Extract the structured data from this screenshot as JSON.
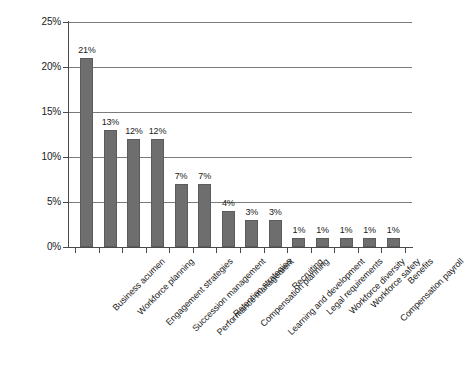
{
  "chart_data": {
    "type": "bar",
    "title": "",
    "subtitle": "",
    "xlabel": "",
    "ylabel": "",
    "ylim": [
      0,
      25
    ],
    "ytick_values": [
      0,
      5,
      10,
      15,
      20,
      25
    ],
    "ytick_labels": [
      "0%",
      "5%",
      "10%",
      "15%",
      "20%",
      "25%"
    ],
    "grid": true,
    "legend": "none",
    "orientation": "vertical",
    "bar_color": "#6e6e6e",
    "bar_edge_color": "#5c5c5c",
    "gridline_color": "#7b7b7b",
    "axis_color": "#4a4a4a",
    "background_color": "#ffffff",
    "value_label_suffix": "%",
    "categories": [
      "Business acumen",
      "Workforce planning",
      "Engagement strategies",
      "Succession management",
      "Performance management",
      "Retention strategies",
      "Compensation planning",
      "Learning and development",
      "Recruiting",
      "Legal requirements",
      "Workforce diversity",
      "Workforce safety",
      "Compensation payroll",
      "Benefits"
    ],
    "values": [
      21,
      13,
      12,
      12,
      7,
      7,
      4,
      3,
      3,
      1,
      1,
      1,
      1,
      1
    ],
    "value_labels": [
      "21%",
      "13%",
      "12%",
      "12%",
      "7%",
      "7%",
      "4%",
      "3%",
      "3%",
      "1%",
      "1%",
      "1%",
      "1%",
      "1%"
    ]
  }
}
